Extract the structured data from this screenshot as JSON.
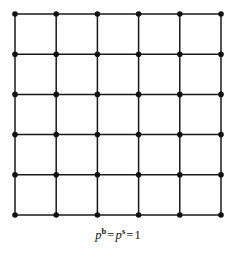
{
  "figure": {
    "name": "square-lattice-diagram",
    "background_color": "#fefefe",
    "line_color": "#1a1a1a",
    "node_color": "#111111",
    "line_width": 1.5,
    "node_radius": 2.8
  },
  "diagram_data": {
    "type": "lattice-graph",
    "description": "Regular square lattice with 6 by 6 nodes forming 5 by 5 cells; every horizontal and vertical edge present",
    "rows": 6,
    "cols": 6,
    "cells_x": 5,
    "cells_y": 5,
    "origin_x": 15,
    "origin_y": 14,
    "spacing_x": 41.2,
    "spacing_y": 40.2,
    "node_count": 36,
    "edge_count": 60,
    "x_positions": [
      15,
      56.2,
      97.4,
      138.6,
      179.8,
      221
    ],
    "y_positions": [
      14,
      54.2,
      94.4,
      134.6,
      174.8,
      215
    ]
  },
  "caption": {
    "full_text": "p^b = p^s = 1",
    "symbol_1": "p",
    "superscript_1": "b",
    "equals_1": "=",
    "symbol_2": "p",
    "superscript_2": "s",
    "equals_2": "=",
    "value": "1"
  }
}
